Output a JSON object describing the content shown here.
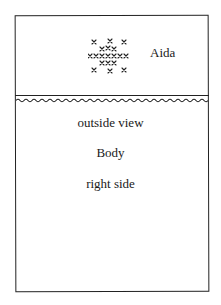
{
  "diagram": {
    "top_section": {
      "fabric_label": "Aida",
      "stitch_pattern_icon": "cross-stitch-motif",
      "stitch_rows": [
        "x.x.x",
        ".xxx.",
        "xxxxxxx",
        ".xxx.",
        "x.x.x"
      ]
    },
    "divider": {
      "type": "fold line with wavy seam"
    },
    "bottom_section": {
      "lines": [
        "outside view",
        "Body",
        "right side"
      ]
    },
    "colors": {
      "ink": "#222222",
      "background": "#ffffff"
    }
  }
}
